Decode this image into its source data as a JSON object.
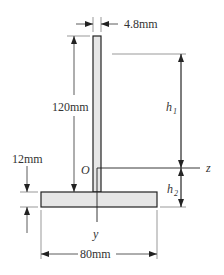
{
  "diagram": {
    "type": "T-section cross-section",
    "colors": {
      "fill": "#e6e6e6",
      "stroke": "#222222",
      "dim": "#444444"
    },
    "dimensions": {
      "web_thickness": "4.8mm",
      "web_height": "120mm",
      "flange_thickness": "12mm",
      "flange_width": "80mm"
    },
    "labels": {
      "origin": "O",
      "z_axis": "z",
      "y_axis": "y",
      "h1": "h",
      "h1_sub": "1",
      "h2": "h",
      "h2_sub": "2"
    }
  }
}
